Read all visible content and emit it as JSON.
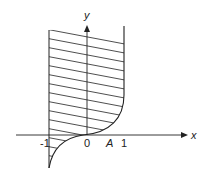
{
  "diagram": {
    "colors": {
      "stroke": "#222222",
      "background": "#ffffff"
    },
    "axes": {
      "x_label": "x",
      "y_label": "y"
    },
    "tick_labels": {
      "neg_one": "-1",
      "zero": "0",
      "a": "A",
      "one": "1"
    }
  }
}
